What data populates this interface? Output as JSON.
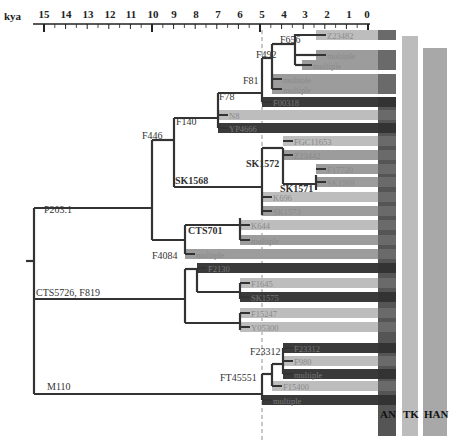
{
  "axis": {
    "unit_label": "kya",
    "ticks": [
      "15",
      "14",
      "13",
      "12",
      "11",
      "10",
      "9",
      "8",
      "7",
      "6",
      "5",
      "4",
      "3",
      "2",
      "1",
      "0"
    ]
  },
  "nodes": [
    {
      "label": "F656"
    },
    {
      "label": "F492"
    },
    {
      "label": "F81"
    },
    {
      "label": "F78"
    },
    {
      "label": "F140"
    },
    {
      "label": "F446"
    },
    {
      "label": "SK1572"
    },
    {
      "label": "SK1571"
    },
    {
      "label": "SK1568"
    },
    {
      "label": "P203.1"
    },
    {
      "label": "CTS701"
    },
    {
      "label": "F4084"
    },
    {
      "label": "CTS5726, F819"
    },
    {
      "label": "F23312"
    },
    {
      "label": "FT45551"
    },
    {
      "label": "M110"
    }
  ],
  "leaves": [
    {
      "label": "Z23482",
      "shade": "light"
    },
    {
      "label": "multiple",
      "shade": "mid"
    },
    {
      "label": "multiple",
      "shade": "mid"
    },
    {
      "label": "multiple",
      "shade": "mid"
    },
    {
      "label": "multiple",
      "shade": "mid"
    },
    {
      "label": "F00318",
      "shade": "dark"
    },
    {
      "label": "N8",
      "shade": "light"
    },
    {
      "label": "YP4666",
      "shade": "dark"
    },
    {
      "label": "FGC11653",
      "shade": "light"
    },
    {
      "label": "Z23442",
      "shade": "mid"
    },
    {
      "label": "F17720",
      "shade": "mid"
    },
    {
      "label": "SK1569",
      "shade": "mid"
    },
    {
      "label": "K696",
      "shade": "light"
    },
    {
      "label": "SK1573",
      "shade": "mid"
    },
    {
      "label": "K644",
      "shade": "light"
    },
    {
      "label": "multiple",
      "shade": "mid"
    },
    {
      "label": "multiple",
      "shade": "mid"
    },
    {
      "label": "F2130",
      "shade": "dark"
    },
    {
      "label": "F1645",
      "shade": "light"
    },
    {
      "label": "SK1575",
      "shade": "dark"
    },
    {
      "label": "F15247",
      "shade": "light"
    },
    {
      "label": "Y05300",
      "shade": "light"
    },
    {
      "label": "F23312",
      "shade": "dark"
    },
    {
      "label": "F980",
      "shade": "light"
    },
    {
      "label": "multiple",
      "shade": "dark"
    },
    {
      "label": "F15400",
      "shade": "light"
    },
    {
      "label": "multiple",
      "shade": "dark"
    }
  ],
  "columns": [
    {
      "label": "AN",
      "color": "#3c3c3c"
    },
    {
      "label": "TK",
      "color": "#b8b8b8"
    },
    {
      "label": "HAN",
      "color": "#a0a0a0"
    }
  ],
  "colors": {
    "branch": "#333333",
    "bar_dark": "#3a3a3a",
    "bar_mid": "#9c9c9c",
    "bar_light": "#bdbdbd",
    "leaf_text": "#8a8a8a",
    "dashed_line": "#777777"
  }
}
